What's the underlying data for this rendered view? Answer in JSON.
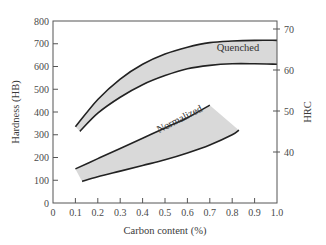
{
  "chart_data": {
    "type": "area",
    "title": "",
    "xlabel": "Carbon content (%)",
    "ylabel": "Hardness (HB)",
    "y2label": "HRC",
    "xlim": [
      0,
      1.0
    ],
    "ylim": [
      0,
      800
    ],
    "y2lim_visible_ticks": [
      40,
      50,
      60,
      70
    ],
    "grid": false,
    "legend": "none (bands labeled inline)",
    "x_ticks": [
      "0",
      "0.1",
      "0.2",
      "0.3",
      "0.4",
      "0.5",
      "0.6",
      "0.7",
      "0.8",
      "0.9",
      "1.0"
    ],
    "y_ticks": [
      "0",
      "100",
      "200",
      "300",
      "400",
      "500",
      "600",
      "700",
      "800"
    ],
    "y2_ticks": [
      "40",
      "50",
      "60",
      "70"
    ],
    "series": [
      {
        "name": "Quenched",
        "kind": "band",
        "upper": {
          "x": [
            0.1,
            0.2,
            0.3,
            0.4,
            0.5,
            0.6,
            0.7,
            0.8,
            0.9,
            1.0
          ],
          "y": [
            335,
            455,
            545,
            610,
            655,
            685,
            705,
            712,
            715,
            715
          ]
        },
        "lower": {
          "x": [
            0.12,
            0.2,
            0.3,
            0.4,
            0.5,
            0.6,
            0.7,
            0.8,
            0.9,
            1.0
          ],
          "y": [
            315,
            395,
            465,
            520,
            560,
            590,
            605,
            612,
            612,
            610
          ]
        }
      },
      {
        "name": "Normalized",
        "kind": "band",
        "upper": {
          "x": [
            0.1,
            0.2,
            0.3,
            0.4,
            0.5,
            0.6,
            0.7
          ],
          "y": [
            150,
            195,
            240,
            285,
            330,
            375,
            430
          ]
        },
        "lower": {
          "x": [
            0.13,
            0.2,
            0.3,
            0.4,
            0.5,
            0.6,
            0.7,
            0.8,
            0.83
          ],
          "y": [
            95,
            115,
            140,
            165,
            190,
            220,
            255,
            300,
            320
          ]
        }
      }
    ]
  },
  "labels": {
    "xlabel": "Carbon content (%)",
    "ylabel": "Hardness (HB)",
    "y2label": "HRC",
    "quenched": "Quenched",
    "normalized": "Normalized"
  },
  "colors": {
    "band_fill": "#d9d9d9",
    "band_edge": "#222222",
    "axis": "#555555"
  }
}
